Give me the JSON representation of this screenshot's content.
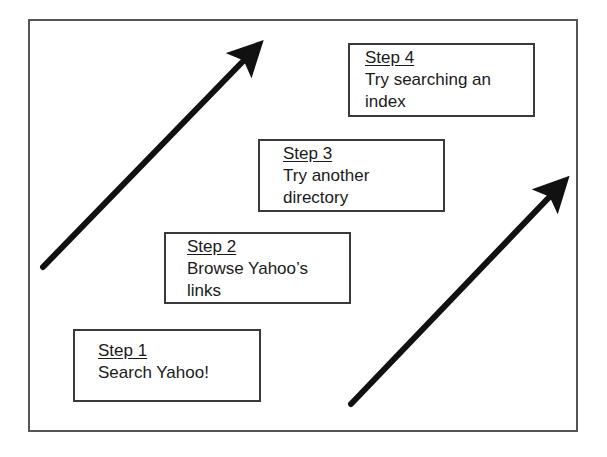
{
  "diagram": {
    "steps": [
      {
        "title": "Step 1",
        "lines": [
          "Search Yahoo!"
        ]
      },
      {
        "title": "Step 2",
        "lines": [
          "Browse Yahoo’s",
          "links"
        ]
      },
      {
        "title": "Step 3",
        "lines": [
          "Try another",
          "directory"
        ]
      },
      {
        "title": "Step 4",
        "lines": [
          "Try searching an",
          "index"
        ]
      }
    ],
    "arrows": [
      {
        "name": "left-arrow",
        "from": [
          43,
          267
        ],
        "to": [
          262,
          42
        ]
      },
      {
        "name": "right-arrow",
        "from": [
          351,
          404
        ],
        "to": [
          568,
          178
        ]
      }
    ],
    "colors": {
      "border": "#3a3a3a",
      "arrow": "#111111",
      "text": "#1a1a1a"
    }
  }
}
